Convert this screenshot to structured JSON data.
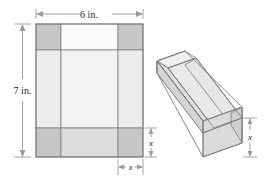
{
  "figure": {
    "labels": {
      "width_label": "6 in.",
      "height_label": "7 in.",
      "corner_label_bottom": "x",
      "corner_label_right_flat": "x",
      "corner_label_right_box": "x"
    },
    "colors": {
      "corner_fill": "#c4c4c4",
      "edge_fill": "#dcdcdc",
      "center_fill": "#f4f4f4",
      "panel_light": "#fbfbfb",
      "box_outer_face": "#d2d2d2",
      "box_inner_face": "#e8e8e8",
      "box_floor": "#dedede",
      "box_rim": "#eeeeee",
      "stroke": "#808080",
      "dim_line": "#9a9a9a",
      "text": "#1a1a1a"
    },
    "flat_sheet": {
      "name": "flat-pattern",
      "description": "Rectangular sheet with square corners of side x removed",
      "width_in": 6,
      "height_in": 7,
      "corner_cut": "x"
    },
    "box": {
      "name": "folded-open-box",
      "description": "Open-top rectangular box formed by folding up the flaps",
      "depth": "x"
    }
  }
}
